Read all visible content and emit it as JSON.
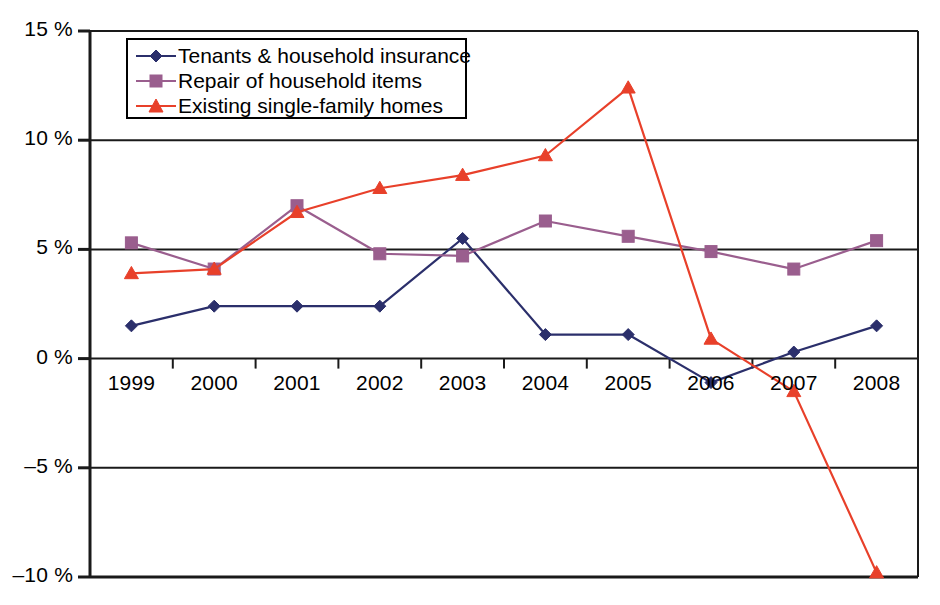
{
  "chart_data": {
    "type": "line",
    "title": "",
    "subtitle": "",
    "xlabel": "",
    "ylabel": "",
    "categories": [
      "1999",
      "2000",
      "2001",
      "2002",
      "2003",
      "2004",
      "2005",
      "2006",
      "2007",
      "2008"
    ],
    "series": [
      {
        "name": "Tenants & household insurance",
        "color": "#2b2f6b",
        "marker": "diamond",
        "values": [
          1.5,
          2.4,
          2.4,
          2.4,
          5.5,
          1.1,
          1.1,
          -1.1,
          0.3,
          1.5
        ]
      },
      {
        "name": "Repair of household items",
        "color": "#9a5e8e",
        "marker": "square",
        "values": [
          5.3,
          4.1,
          7.0,
          4.8,
          4.7,
          6.3,
          5.6,
          4.9,
          4.1,
          5.4
        ]
      },
      {
        "name": "Existing single-family homes",
        "color": "#e8402a",
        "marker": "triangle",
        "values": [
          3.9,
          4.1,
          6.7,
          7.8,
          8.4,
          9.3,
          12.4,
          0.9,
          -1.5,
          -9.8
        ]
      }
    ],
    "ylim": [
      -10,
      15
    ],
    "ytick_values": [
      15,
      10,
      5,
      0,
      -5,
      -10
    ],
    "ytick_labels": [
      "15 %",
      "10 %",
      "5 %",
      "0 %",
      "–5 %",
      "–10 %"
    ],
    "grid": true,
    "grid_axis": "y",
    "legend_position": "top-left-inside",
    "legend_entries": [
      "Tenants & household insurance",
      "Repair of household items",
      "Existing single-family homes"
    ],
    "annotations": []
  }
}
